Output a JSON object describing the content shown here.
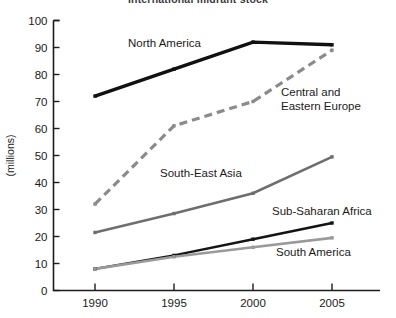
{
  "chart_data": {
    "type": "line",
    "title": "International migrant stock",
    "xlabel": "",
    "ylabel": "(millions)",
    "x": [
      "1990",
      "1995",
      "2000",
      "2005"
    ],
    "categories": [
      "1990",
      "1995",
      "2000",
      "2005"
    ],
    "ylim": [
      0,
      100
    ],
    "ytick_step": 10,
    "yticks": [
      "0",
      "10",
      "20",
      "30",
      "40",
      "50",
      "60",
      "70",
      "80",
      "90",
      "100"
    ],
    "grid": false,
    "legend_position": "inline-labels",
    "series": [
      {
        "name": "North America",
        "values": [
          72,
          82,
          92,
          91
        ],
        "color": "#111111",
        "style": "solid",
        "width": 3.4,
        "label_x": 128,
        "label_y": 47
      },
      {
        "name": "Central and Eastern Europe",
        "label_lines": [
          "Central and",
          "Eastern Europe"
        ],
        "values": [
          32,
          61,
          70,
          89
        ],
        "color": "#8b8b8b",
        "style": "dashed",
        "width": 3.2,
        "label_x": 281,
        "label_y": 96
      },
      {
        "name": "South-East Asia",
        "values": [
          21.5,
          28.5,
          36,
          49.5
        ],
        "color": "#6e6e6e",
        "style": "solid",
        "width": 2.6,
        "label_x": 160,
        "label_y": 177
      },
      {
        "name": "Sub-Saharan Africa",
        "values": [
          8,
          13,
          19,
          25
        ],
        "color": "#141414",
        "style": "solid",
        "width": 2.4,
        "label_x": 272,
        "label_y": 215
      },
      {
        "name": "South America",
        "values": [
          8,
          12.5,
          16,
          19.5
        ],
        "color": "#9a9a9a",
        "style": "solid",
        "width": 2.6,
        "label_x": 276,
        "label_y": 256
      }
    ]
  }
}
